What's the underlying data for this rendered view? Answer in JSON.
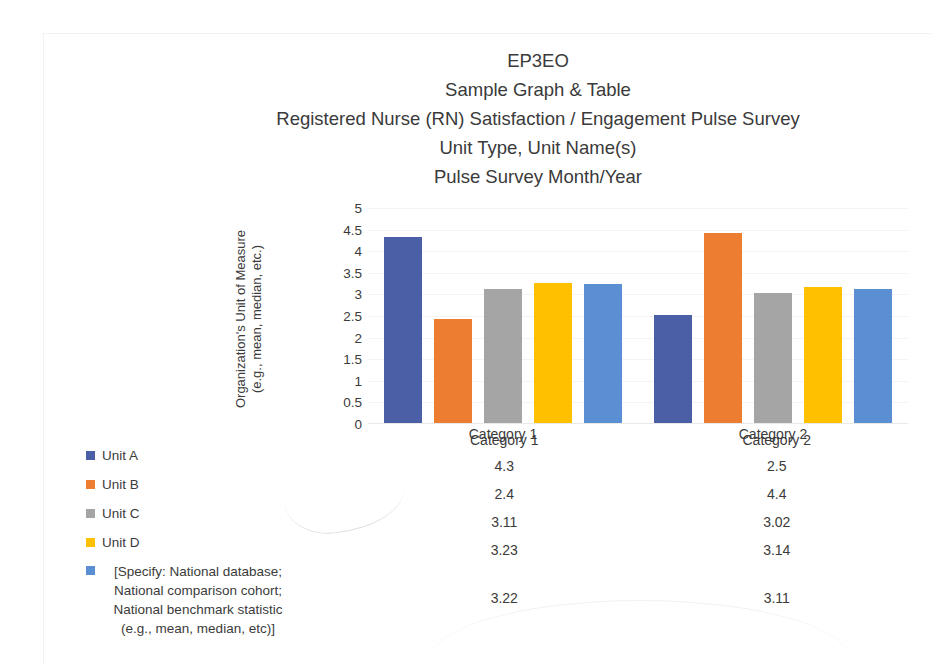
{
  "document": {
    "title_lines": [
      "EP3EO",
      "Sample Graph & Table",
      "Registered Nurse (RN) Satisfaction / Engagement Pulse Survey",
      "Unit Type, Unit Name(s)",
      "Pulse Survey Month/Year"
    ]
  },
  "axis": {
    "y_title_line1": "Organization's Unit of Measure",
    "y_title_line2": "(e.g., mean, median, etc.)"
  },
  "legend": {
    "items": [
      {
        "label": "Unit A",
        "color": "#4a5fa5",
        "wrapped": false
      },
      {
        "label": "Unit B",
        "color": "#ed7d31",
        "wrapped": false
      },
      {
        "label": "Unit C",
        "color": "#a5a5a5",
        "wrapped": false
      },
      {
        "label": "Unit D",
        "color": "#ffc000",
        "wrapped": false
      },
      {
        "label": "[Specify: National database; National comparison cohort; National benchmark statistic (e.g., mean, median, etc)]",
        "color": "#5b8fd4",
        "wrapped": true
      }
    ]
  },
  "table": {
    "headers": [
      "Category 1",
      "Category 2"
    ],
    "rows": [
      [
        "4.3",
        "2.5"
      ],
      [
        "2.4",
        "4.4"
      ],
      [
        "3.11",
        "3.02"
      ],
      [
        "3.23",
        "3.14"
      ],
      [
        "3.22",
        "3.11"
      ]
    ]
  },
  "chart_data": {
    "type": "bar",
    "title": "Registered Nurse (RN) Satisfaction / Engagement Pulse Survey",
    "xlabel": "",
    "ylabel": "Organization's Unit of Measure (e.g., mean, median, etc.)",
    "ylim": [
      0,
      5
    ],
    "yticks": [
      "5",
      "4.5",
      "4",
      "3.5",
      "3",
      "2.5",
      "2",
      "1.5",
      "1",
      "0.5",
      "0"
    ],
    "ytick_values": [
      5,
      4.5,
      4,
      3.5,
      3,
      2.5,
      2,
      1.5,
      1,
      0.5,
      0
    ],
    "grid": true,
    "legend_position": "left",
    "categories": [
      "Category 1",
      "Category 2"
    ],
    "series": [
      {
        "name": "Unit A",
        "color": "#4a5fa5",
        "values": [
          4.3,
          2.5
        ]
      },
      {
        "name": "Unit B",
        "color": "#ed7d31",
        "values": [
          2.4,
          4.4
        ]
      },
      {
        "name": "Unit C",
        "color": "#a5a5a5",
        "values": [
          3.11,
          3.02
        ]
      },
      {
        "name": "Unit D",
        "color": "#ffc000",
        "values": [
          3.23,
          3.14
        ]
      },
      {
        "name": "[Specify: National database; National comparison cohort; National benchmark statistic (e.g., mean, median, etc)]",
        "color": "#5b8fd4",
        "values": [
          3.22,
          3.11
        ]
      }
    ]
  }
}
